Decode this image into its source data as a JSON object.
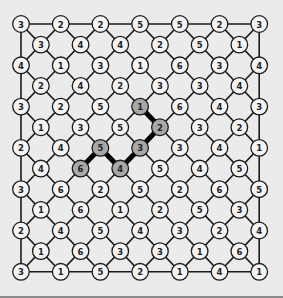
{
  "puzzle": {
    "rows": [
      [
        3,
        2,
        2,
        5,
        5,
        2,
        3
      ],
      [
        3,
        4,
        4,
        2,
        5,
        1
      ],
      [
        4,
        1,
        3,
        1,
        6,
        3,
        4
      ],
      [
        2,
        4,
        2,
        3,
        3,
        4
      ],
      [
        3,
        2,
        5,
        1,
        6,
        4,
        3
      ],
      [
        1,
        3,
        5,
        2,
        3,
        2
      ],
      [
        2,
        4,
        5,
        3,
        3,
        4,
        1
      ],
      [
        4,
        6,
        4,
        5,
        4,
        5
      ],
      [
        3,
        6,
        2,
        5,
        2,
        6,
        5
      ],
      [
        1,
        6,
        1,
        2,
        5,
        3
      ],
      [
        2,
        4,
        5,
        4,
        3,
        2,
        4
      ],
      [
        1,
        6,
        3,
        3,
        1,
        6
      ],
      [
        3,
        1,
        5,
        2,
        1,
        4,
        1
      ]
    ],
    "highlighted_path": [
      {
        "row": 4,
        "col": 3,
        "value": 1
      },
      {
        "row": 5,
        "col": 3,
        "value": 2
      },
      {
        "row": 6,
        "col": 3,
        "value": 3
      },
      {
        "row": 7,
        "col": 2,
        "value": 4
      },
      {
        "row": 6,
        "col": 2,
        "value": 5
      },
      {
        "row": 7,
        "col": 1,
        "value": 6
      }
    ]
  },
  "colors": {
    "background": "#ebebeb",
    "node_fill": "#f4f4f4",
    "highlight_fill": "#a8a8a8",
    "line": "#1a1a1a"
  }
}
